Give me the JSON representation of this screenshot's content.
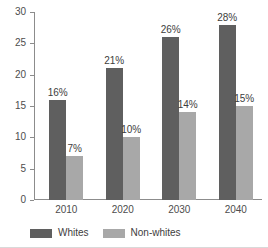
{
  "chart_data": {
    "type": "bar",
    "title": "",
    "subtitle": "",
    "xlabel": "",
    "ylabel": "",
    "categories": [
      "2010",
      "2020",
      "2030",
      "2040"
    ],
    "series": [
      {
        "name": "Whites",
        "values": [
          16,
          21,
          26,
          28
        ],
        "color": "#5f5f5f",
        "data_labels": [
          "16%",
          "21%",
          "26%",
          "28%"
        ]
      },
      {
        "name": "Non-whites",
        "values": [
          7,
          10,
          14,
          15
        ],
        "color": "#a8a8a8",
        "data_labels": [
          "7%",
          "10%",
          "14%",
          "15%"
        ]
      }
    ],
    "ylim": [
      0,
      30
    ],
    "yticks": [
      0,
      5,
      10,
      15,
      20,
      25,
      30
    ],
    "ytick_labels": [
      "0",
      "5",
      "10",
      "15",
      "20",
      "25",
      "30"
    ],
    "grid": false,
    "legend_position": "bottom-left",
    "value_suffix": "%"
  },
  "legend": {
    "items": [
      {
        "label": "Whites",
        "color": "#5f5f5f"
      },
      {
        "label": "Non-whites",
        "color": "#a8a8a8"
      }
    ]
  },
  "colors": {
    "series_whites": "#5f5f5f",
    "series_nonwhites": "#a8a8a8",
    "axis": "#8c8c8c",
    "text": "#4d4d4d",
    "background": "#ffffff"
  }
}
